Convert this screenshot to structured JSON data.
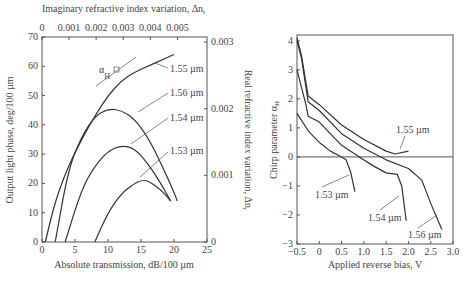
{
  "chart_data": [
    {
      "type": "line",
      "title": "",
      "xlabel": "Absolute transmission, dB/100 µm",
      "ylabel": "Output light phase, deg/100 µm",
      "x2label": "Imaginary refractive index variation, Δn_i",
      "y2label": "Real refractive index variation, Δn_r",
      "xlim": [
        0,
        25
      ],
      "ylim": [
        0,
        70
      ],
      "x2lim": [
        0,
        0.006
      ],
      "y2lim": [
        0,
        0.003
      ],
      "xticks": [
        "0",
        "5",
        "10",
        "15",
        "20",
        "25"
      ],
      "yticks": [
        "0",
        "10",
        "20",
        "30",
        "40",
        "50",
        "60",
        "70"
      ],
      "x2ticks": [
        "0",
        "0.001",
        "0.002",
        "0.003",
        "0.004",
        "0.005"
      ],
      "y2ticks": [
        "0",
        "0.001",
        "0.002",
        "0.003"
      ],
      "annotation": "αH",
      "series": [
        {
          "name": "1.55 µm",
          "x": [
            0.5,
            2,
            4,
            6,
            8,
            10,
            12,
            14,
            16,
            18,
            20
          ],
          "y": [
            0,
            14,
            26,
            35,
            43,
            50,
            55,
            58,
            60,
            62,
            64
          ]
        },
        {
          "name": "1.56 µm",
          "x": [
            2,
            4,
            6,
            8,
            10,
            12,
            14,
            16,
            18,
            20,
            20.5
          ],
          "y": [
            0,
            25,
            36,
            43,
            45.5,
            45,
            42,
            36,
            27,
            17,
            14
          ]
        },
        {
          "name": "1.54 µm",
          "x": [
            3.5,
            6,
            8,
            10,
            12,
            14,
            16,
            18,
            19.5
          ],
          "y": [
            0,
            18,
            26,
            31,
            33,
            32,
            27,
            20,
            14
          ]
        },
        {
          "name": "1.53 µm",
          "x": [
            8,
            10,
            12,
            14,
            15,
            16,
            18,
            19.5
          ],
          "y": [
            0,
            10,
            16.5,
            20,
            21,
            21,
            18,
            14
          ]
        }
      ]
    },
    {
      "type": "line",
      "title": "",
      "xlabel": "Applied reverse bias, V",
      "ylabel": "Chirp parameter αH",
      "xlim": [
        -0.5,
        3.0
      ],
      "ylim": [
        -3,
        4.2
      ],
      "xticks": [
        "-0.5",
        "0",
        "0.5",
        "1.0",
        "1.5",
        "2.0",
        "2.5",
        "3.0"
      ],
      "yticks": [
        "-3",
        "-2",
        "-1",
        "0",
        "1",
        "2",
        "3",
        "4"
      ],
      "hline": 0,
      "series": [
        {
          "name": "1.55 µm",
          "x": [
            -0.5,
            -0.4,
            -0.25,
            0,
            0.5,
            1.0,
            1.5,
            1.7,
            2.0
          ],
          "y": [
            4.1,
            3.5,
            2.1,
            1.8,
            1.1,
            0.6,
            0.2,
            0.1,
            0.2
          ]
        },
        {
          "name": "1.56 µm",
          "x": [
            -0.5,
            -0.4,
            -0.25,
            0,
            0.5,
            1.0,
            1.5,
            2.0,
            2.3,
            2.5,
            2.75
          ],
          "y": [
            4.0,
            3.4,
            1.9,
            1.6,
            0.8,
            0.3,
            -0.1,
            -0.4,
            -0.8,
            -1.6,
            -2.5
          ]
        },
        {
          "name": "1.54 µm",
          "x": [
            -0.5,
            -0.3,
            -0.25,
            0,
            0.5,
            0.9,
            1.2,
            1.5,
            1.75,
            1.85,
            1.95
          ],
          "y": [
            3.0,
            1.8,
            1.4,
            1.2,
            0.4,
            0.0,
            -0.3,
            -0.55,
            -0.6,
            -1.0,
            -2.2
          ]
        },
        {
          "name": "1.53 µm",
          "x": [
            -0.5,
            -0.25,
            0,
            0.25,
            0.5,
            0.6,
            0.7,
            0.8
          ],
          "y": [
            1.5,
            0.9,
            0.5,
            0.2,
            0.0,
            -0.1,
            -0.5,
            -1.2
          ]
        }
      ]
    }
  ],
  "left": {
    "top_label": "Imaginary refractive index variation, Δn",
    "top_label_sub": "i",
    "right_label": "Real refractive index variation, Δn",
    "right_label_sub": "r",
    "left_label": "Output light phase, deg/100 µm",
    "bottom_label": "Absolute transmission, dB/100 µm",
    "alpha": "α",
    "alpha_sub": "H",
    "series_labels": [
      "1.55 µm",
      "1.56 µm",
      "1.54 µm",
      "1.53 µm"
    ]
  },
  "right": {
    "left_label": "Chirp parameter α",
    "left_label_sub": "H",
    "bottom_label": "Applied reverse bias, V",
    "series_labels": [
      "1.55 µm",
      "1.53 µm",
      "1.54 µm",
      "1.56 µm"
    ]
  }
}
